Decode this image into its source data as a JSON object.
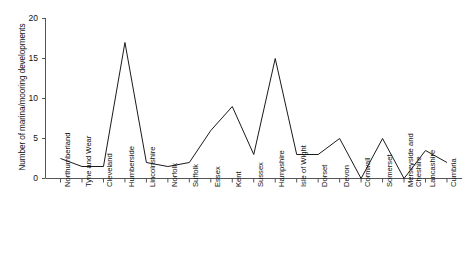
{
  "chart_data": {
    "type": "line",
    "title": "",
    "subtitle": "",
    "xlabel": "",
    "ylabel": "Number of marina/mooring developments",
    "ylim": [
      0,
      20
    ],
    "yticks": [
      0,
      5,
      10,
      15,
      20
    ],
    "ytick_labels": [
      "0",
      "5",
      "10",
      "15",
      "20"
    ],
    "grid": false,
    "legend": false,
    "legend_position": "none",
    "line_color": "#1a1a1a",
    "background_color": "#ffffff",
    "categories": [
      "Northumberland",
      "Tyne and Wear",
      "Cleveland",
      "Humberside",
      "Lincolnshire",
      "Norfolk",
      "Suffolk",
      "Essex",
      "Kent",
      "Sussex",
      "Hampshire",
      "Isle of Wight",
      "Dorset",
      "Devon",
      "Cornwall",
      "Somerset",
      "Merseyside and Cheshire",
      "Lancashire",
      "Cumbria"
    ],
    "values": [
      2.5,
      1.5,
      1.5,
      17,
      2,
      1.5,
      2,
      6,
      9,
      3,
      15,
      3,
      3,
      5,
      0,
      5,
      0,
      3.5,
      2
    ]
  },
  "axes": {
    "y_title": "Number of marina/mooring developments"
  }
}
